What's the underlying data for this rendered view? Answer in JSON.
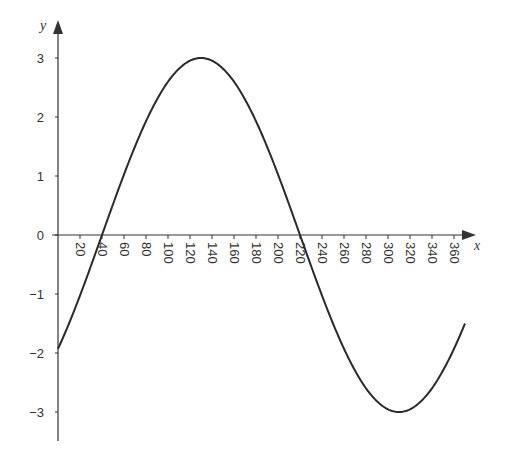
{
  "chart_data": {
    "type": "line",
    "title": "",
    "xlabel": "x",
    "ylabel": "y",
    "function": "y = 3 sin(x - 40)",
    "xlim": [
      0,
      370
    ],
    "ylim": [
      -3.5,
      3.3
    ],
    "grid": false,
    "legend": null,
    "x_ticks": [
      20,
      40,
      60,
      80,
      100,
      120,
      140,
      160,
      180,
      200,
      220,
      240,
      260,
      280,
      300,
      320,
      340,
      360
    ],
    "x_tick_labels": [
      "20",
      "40",
      "60",
      "80",
      "100",
      "120",
      "140",
      "160",
      "180",
      "200",
      "220",
      "240",
      "260",
      "280",
      "300",
      "320",
      "340",
      "360"
    ],
    "y_ticks": [
      3,
      2,
      1,
      0,
      -1,
      -2,
      -3
    ],
    "y_tick_labels": [
      "3",
      "2",
      "1",
      "0",
      "−1",
      "−2",
      "−3"
    ],
    "series": [
      {
        "name": "curve",
        "color": "#2a2a2a",
        "x": [
          0,
          20,
          40,
          60,
          80,
          100,
          120,
          130,
          140,
          160,
          180,
          200,
          220,
          240,
          260,
          280,
          300,
          310,
          320,
          340,
          360,
          370
        ],
        "y": [
          -1.93,
          -1.03,
          0,
          1.03,
          1.93,
          2.6,
          2.95,
          3.0,
          2.95,
          2.6,
          1.93,
          1.03,
          0,
          -1.03,
          -1.93,
          -2.6,
          -2.95,
          -3.0,
          -2.95,
          -2.6,
          -1.93,
          -1.5
        ]
      }
    ],
    "key_points": {
      "start": [
        0,
        -2
      ],
      "max": [
        130,
        3
      ],
      "min": [
        310,
        -3
      ],
      "zeros": [
        40,
        220
      ],
      "end": [
        370,
        -1.5
      ]
    }
  }
}
